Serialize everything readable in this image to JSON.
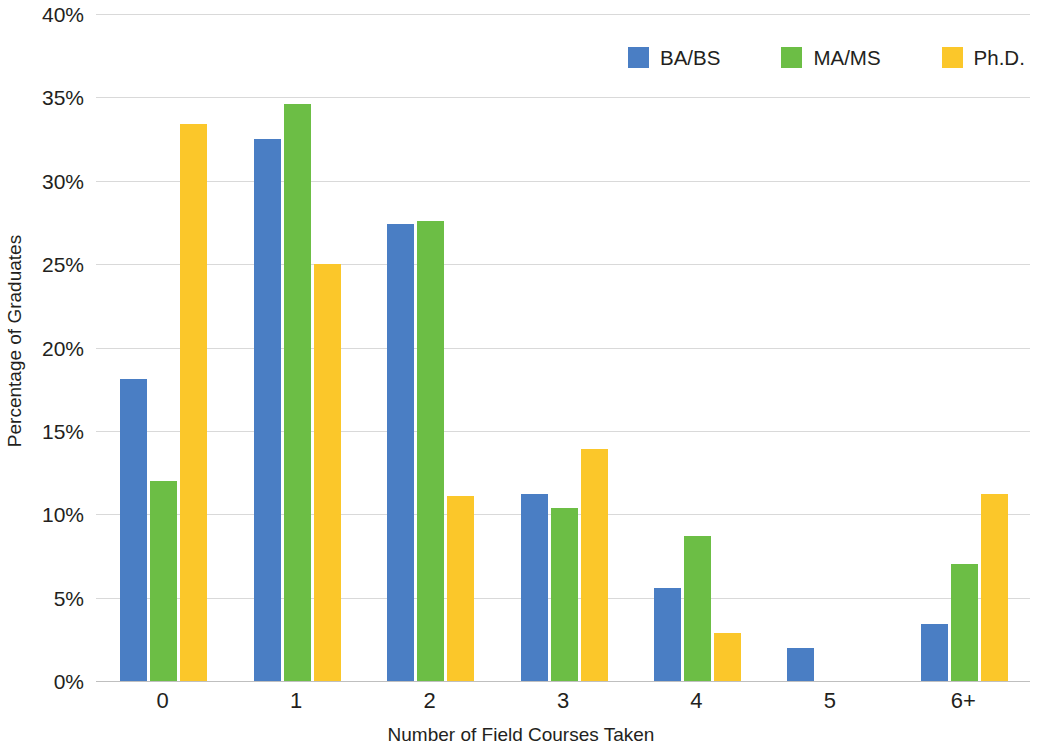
{
  "chart_data": {
    "type": "bar",
    "title": "",
    "xlabel": "Number of Field Courses Taken",
    "ylabel": "Percentage of Graduates",
    "categories": [
      "0",
      "1",
      "2",
      "3",
      "4",
      "5",
      "6+"
    ],
    "ylim": [
      0,
      40
    ],
    "ytick_labels": [
      "0%",
      "5%",
      "10%",
      "15%",
      "20%",
      "25%",
      "30%",
      "35%",
      "40%"
    ],
    "ytick_values": [
      0,
      5,
      10,
      15,
      20,
      25,
      30,
      35,
      40
    ],
    "grid": true,
    "legend_position": "top-right",
    "series": [
      {
        "name": "BA/BS",
        "color": "#4a7ec4",
        "values": [
          18.1,
          32.5,
          27.4,
          11.2,
          5.6,
          2.0,
          3.4
        ]
      },
      {
        "name": "MA/MS",
        "color": "#6cbe45",
        "values": [
          12.0,
          34.6,
          27.6,
          10.4,
          8.7,
          0,
          7.0
        ]
      },
      {
        "name": "Ph.D.",
        "color": "#fbc72a",
        "values": [
          33.4,
          25.0,
          11.1,
          13.9,
          2.9,
          0,
          11.2
        ]
      }
    ]
  },
  "legend": {
    "entries": [
      {
        "label": "BA/BS",
        "color": "#4a7ec4"
      },
      {
        "label": "MA/MS",
        "color": "#6cbe45"
      },
      {
        "label": "Ph.D.",
        "color": "#fbc72a"
      }
    ]
  },
  "axes": {
    "y_title": "Percentage of Graduates",
    "x_title": "Number of Field Courses Taken"
  }
}
